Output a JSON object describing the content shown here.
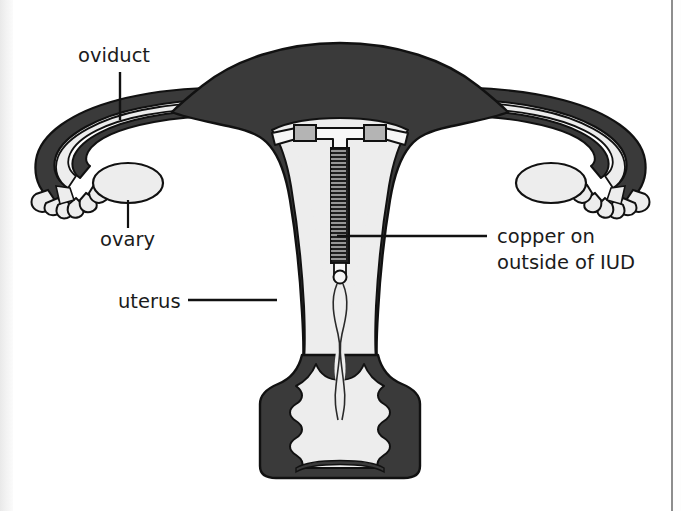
{
  "figure": {
    "type": "anatomical-diagram",
    "background_color": "#ffffff"
  },
  "colors": {
    "muscle_dark": "#3a3a3a",
    "cavity_light": "#ededed",
    "outline": "#111111",
    "copper_sleeve": "#b4b4b4",
    "coil_dark": "#1e1e1e",
    "text": "#1b1b1b",
    "page": "#ffffff"
  },
  "labels": {
    "oviduct": {
      "text": "oviduct",
      "x": 78,
      "y": 62,
      "anchor": "start",
      "leader": {
        "x1": 120,
        "y1": 72,
        "x2": 120,
        "y2": 120,
        "orientation": "vertical"
      }
    },
    "ovary": {
      "text": "ovary",
      "x": 100,
      "y": 244,
      "anchor": "start",
      "leader": {
        "x1": 128,
        "y1": 196,
        "x2": 128,
        "y2": 228,
        "orientation": "vertical"
      }
    },
    "uterus": {
      "text": "uterus",
      "x": 118,
      "y": 307,
      "anchor": "start",
      "leader": {
        "x1": 188,
        "y1": 300,
        "x2": 274,
        "y2": 300,
        "orientation": "horizontal"
      }
    },
    "copper": {
      "line1": "copper on",
      "line2": "outside of IUD",
      "x": 497,
      "y": 243,
      "line2_y": 268,
      "anchor": "start",
      "leader": {
        "x1": 337,
        "y1": 236,
        "x2": 487,
        "y2": 236,
        "orientation": "horizontal"
      }
    }
  },
  "parts": [
    {
      "name": "uterus-fundus",
      "kind": "myometrium"
    },
    {
      "name": "uterine-cavity",
      "kind": "endometrial-cavity"
    },
    {
      "name": "left-oviduct",
      "kind": "fallopian-tube"
    },
    {
      "name": "right-oviduct",
      "kind": "fallopian-tube"
    },
    {
      "name": "left-fimbriae",
      "kind": "fimbriae"
    },
    {
      "name": "right-fimbriae",
      "kind": "fimbriae"
    },
    {
      "name": "left-ovary",
      "kind": "ovary"
    },
    {
      "name": "right-ovary",
      "kind": "ovary"
    },
    {
      "name": "cervix",
      "kind": "cervix"
    },
    {
      "name": "vagina",
      "kind": "vagina"
    },
    {
      "name": "iud-device",
      "kind": "intrauterine-device"
    },
    {
      "name": "iud-strings",
      "kind": "retrieval-threads"
    }
  ],
  "iud": {
    "shape": "T",
    "stem_coil_turns": 31,
    "arm_sleeves": 2,
    "description": "T-shaped copper IUD with copper wire wound on the vertical stem and copper sleeves on the horizontal arms"
  }
}
